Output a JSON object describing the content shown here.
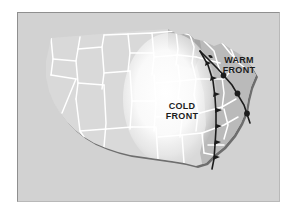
{
  "figure": {
    "kind": "weather-map-diagram",
    "region": "Contiguous United States",
    "background_color": "#ffffff",
    "panel_color": "#d2d2d2",
    "panel_border_color": "#8f8f8f"
  },
  "map": {
    "land_color": "#d9d9d9",
    "state_border_color": "#ffffff",
    "coast_shadow_color": "#6e6e6e",
    "east_shading_color": "#b4b4b4",
    "airmass_color": "#ffffff",
    "airmass_name": "cold air mass"
  },
  "labels": {
    "cold_front": "COLD\nFRONT",
    "warm_front": "WARM\nFRONT"
  },
  "fronts": [
    {
      "name": "cold-front",
      "type": "cold",
      "symbol": "triangle",
      "symbol_direction": "east",
      "line_color": "#1c1c1c",
      "line_width": 1.6,
      "symbol_count": 7
    },
    {
      "name": "warm-front",
      "type": "warm",
      "symbol": "semicircle",
      "symbol_direction": "southeast",
      "line_color": "#1c1c1c",
      "line_width": 1.6,
      "symbol_count": 4
    }
  ]
}
